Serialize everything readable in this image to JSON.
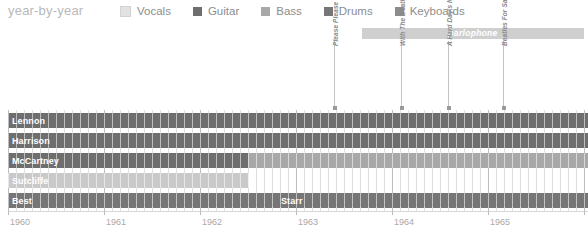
{
  "header": {
    "title": "year-by-year"
  },
  "legend": {
    "items": [
      {
        "label": "Vocals",
        "color": "#e2e2e2"
      },
      {
        "label": "Guitar",
        "color": "#6e6e6e"
      },
      {
        "label": "Bass",
        "color": "#a8a8a8"
      },
      {
        "label": "Drums",
        "color": "#767676"
      },
      {
        "label": "Keyboards",
        "color": "#8c8c8c"
      }
    ]
  },
  "label_bands": [
    {
      "name": "parlophone",
      "x": 362,
      "width": 222,
      "color": "#cfcfcf"
    }
  ],
  "markers": [
    {
      "label": "Please Please Me",
      "x": 334
    },
    {
      "label": "With The Beatles",
      "x": 401
    },
    {
      "label": "A Hard Day's Night",
      "x": 448
    },
    {
      "label": "Beatles For Sale",
      "x": 503
    }
  ],
  "rows": [
    {
      "name": "Lennon",
      "y": 113,
      "height": 15,
      "segments": [
        {
          "x": 8,
          "width": 580,
          "color": "#6e6e6e"
        }
      ]
    },
    {
      "name": "Harrison",
      "y": 133,
      "height": 15,
      "segments": [
        {
          "x": 8,
          "width": 580,
          "color": "#6e6e6e"
        }
      ]
    },
    {
      "name": "McCartney",
      "y": 153,
      "height": 15,
      "segments": [
        {
          "x": 8,
          "width": 240,
          "color": "#6e6e6e"
        },
        {
          "x": 248,
          "width": 340,
          "color": "#a8a8a8"
        }
      ]
    },
    {
      "name": "Sutcliffe",
      "y": 173,
      "height": 15,
      "segments": [
        {
          "x": 8,
          "width": 240,
          "color": "#c9c9c9"
        }
      ]
    },
    {
      "name": "Best",
      "y": 193,
      "height": 15,
      "segments": [
        {
          "x": 8,
          "width": 269,
          "color": "#767676"
        }
      ]
    },
    {
      "name": "Starr",
      "y": 193,
      "height": 15,
      "segments": [
        {
          "x": 277,
          "width": 311,
          "color": "#767676"
        }
      ]
    }
  ],
  "axis": {
    "years": [
      {
        "label": "1960",
        "x": 8
      },
      {
        "label": "1961",
        "x": 104
      },
      {
        "label": "1962",
        "x": 200
      },
      {
        "label": "1963",
        "x": 296
      },
      {
        "label": "1964",
        "x": 392
      },
      {
        "label": "1965",
        "x": 488
      }
    ],
    "x_start": 8,
    "x_end": 588,
    "minor_step": 8,
    "major_step": 96,
    "axis_y": 211
  },
  "chart_data": {
    "type": "bar",
    "title": "year-by-year",
    "xlabel": "",
    "ylabel": "",
    "categories": [
      "Lennon",
      "Harrison",
      "McCartney",
      "Sutcliffe",
      "Best",
      "Starr"
    ],
    "x_axis_ticks": [
      "1960",
      "1961",
      "1962",
      "1963",
      "1964",
      "1965"
    ],
    "legend_entries": [
      "Vocals",
      "Guitar",
      "Bass",
      "Drums",
      "Keyboards"
    ],
    "legend_position": "top",
    "grid": true,
    "annotations": [
      "parlophone",
      "Please Please Me",
      "With The Beatles",
      "A Hard Day's Night",
      "Beatles For Sale"
    ],
    "series": [
      {
        "name": "Lennon",
        "role": "Guitar",
        "start": "1960",
        "end": "1966"
      },
      {
        "name": "Harrison",
        "role": "Guitar",
        "start": "1960",
        "end": "1966"
      },
      {
        "name": "McCartney",
        "role": "Guitar/Bass",
        "start": "1960",
        "end": "1966",
        "switch": "1962"
      },
      {
        "name": "Sutcliffe",
        "role": "Vocals",
        "start": "1960",
        "end": "1962"
      },
      {
        "name": "Best",
        "role": "Drums",
        "start": "1960",
        "end": "1962"
      },
      {
        "name": "Starr",
        "role": "Drums",
        "start": "1962",
        "end": "1966"
      }
    ]
  }
}
